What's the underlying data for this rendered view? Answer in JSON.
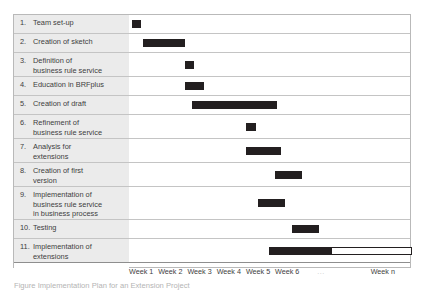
{
  "figure": {
    "caption": "Figure  Implementation Plan for an Extension Project"
  },
  "chart_data": {
    "type": "bar",
    "title": "",
    "xlabel": "",
    "ylabel": "",
    "orientation": "horizontal",
    "subtype": "gantt",
    "grid": true,
    "legend": "none",
    "x_axis": {
      "unit": "week",
      "ticks": [
        "Week 1",
        "Week 2",
        "Week 3",
        "Week 4",
        "Week 5",
        "Week 6",
        "...",
        "Week n"
      ],
      "tick_positions_pct": [
        0.0,
        10.4,
        20.8,
        31.2,
        41.6,
        52.0,
        67.0,
        86.0
      ]
    },
    "categories": [
      "1. Team set-up",
      "2. Creation of sketch",
      "3. Definition of business rule service",
      "4. Education in BRFplus",
      "5. Creation of draft",
      "6. Refinement of business rule service",
      "7. Analysis for extensions",
      "8. Creation of first version",
      "9. Implementation of business rule service in business process",
      "10. Testing",
      "11. Implementation of extensions"
    ],
    "tasks": [
      {
        "num": "1.",
        "label": "Team set-up",
        "start_week": 0.1,
        "end_week": 0.42,
        "fill": "solid"
      },
      {
        "num": "2.",
        "label": "Creation of sketch",
        "start_week": 0.47,
        "end_week": 1.92,
        "fill": "solid"
      },
      {
        "num": "3.",
        "label": "Definition of\nbusiness rule service",
        "start_week": 1.92,
        "end_week": 2.22,
        "fill": "solid"
      },
      {
        "num": "4.",
        "label": "Education in BRFplus",
        "start_week": 1.92,
        "end_week": 2.55,
        "fill": "solid"
      },
      {
        "num": "5.",
        "label": "Creation of draft",
        "start_week": 2.15,
        "end_week": 5.05,
        "fill": "solid"
      },
      {
        "num": "6.",
        "label": "Refinement of\nbusiness rule service",
        "start_week": 4.0,
        "end_week": 4.35,
        "fill": "solid"
      },
      {
        "num": "7.",
        "label": "Analysis for\nextensions",
        "start_week": 4.0,
        "end_week": 5.2,
        "fill": "solid"
      },
      {
        "num": "8.",
        "label": "Creation of first\nversion",
        "start_week": 5.0,
        "end_week": 5.92,
        "fill": "solid"
      },
      {
        "num": "9.",
        "label": "Implementation of\nbusiness rule service\nin business process",
        "start_week": 4.4,
        "end_week": 5.35,
        "fill": "solid"
      },
      {
        "num": "10.",
        "label": "Testing",
        "start_week": 5.58,
        "end_week": 6.5,
        "fill": "solid"
      },
      {
        "num": "11.",
        "label": "Implementation of\nextensions",
        "start_week": 4.8,
        "end_week": 6.9,
        "fill": "solid",
        "open_start_week": 6.9,
        "open_end_week": 9.7
      }
    ],
    "bar_color": "#231f20",
    "open_bar_color": "#ffffff",
    "row_label_bg": "#ebebeb",
    "gridline_color": "#c4c4c4"
  }
}
